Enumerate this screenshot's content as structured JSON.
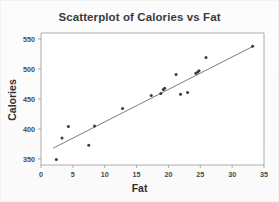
{
  "chart_data": {
    "type": "scatter",
    "title": "Scatterplot of Calories vs Fat",
    "xlabel": "Fat",
    "ylabel": "Calories",
    "xlim": [
      0,
      35
    ],
    "ylim": [
      340,
      560
    ],
    "xticks": [
      0,
      5,
      10,
      15,
      20,
      25,
      30,
      35
    ],
    "yticks": [
      350,
      400,
      450,
      500,
      550
    ],
    "grid": false,
    "legend": false,
    "point_color": "#3a3a46",
    "line_color": "#6b6b78",
    "series": [
      {
        "name": "Calories vs Fat",
        "x": [
          2.4,
          3.3,
          4.3,
          7.5,
          8.4,
          12.8,
          17.3,
          18.8,
          19.2,
          19.4,
          21.2,
          21.9,
          23.0,
          24.3,
          24.6,
          24.8,
          25.9,
          33.2
        ],
        "y": [
          349,
          385,
          404,
          373,
          405,
          434,
          456,
          459,
          466,
          468,
          491,
          458,
          461,
          493,
          495,
          497,
          519,
          538
        ]
      }
    ],
    "fit_line": {
      "name": "least-squares fit",
      "x": [
        1.9,
        33.5
      ],
      "y": [
        368,
        539
      ]
    }
  }
}
